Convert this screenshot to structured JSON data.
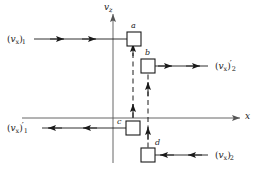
{
  "figure": {
    "background_color": "#ffffff",
    "line_color": "#1a1a1a",
    "axis_color": "#555555",
    "dashed_color": "#1a1a1a"
  },
  "axes": {
    "vertical": {
      "label_text": "v",
      "label_sub": "z",
      "name": "v_z"
    },
    "horizontal": {
      "label_text": "x",
      "name": "x"
    }
  },
  "boxes": [
    {
      "id": "a",
      "label": "a"
    },
    {
      "id": "b",
      "label": "b"
    },
    {
      "id": "c",
      "label": "c"
    },
    {
      "id": "d",
      "label": "d"
    }
  ],
  "velocity_labels": {
    "incoming_1": {
      "open_paren": "(",
      "symbol": "v",
      "symbol_sub": "x",
      "close_paren": ")",
      "prime": "",
      "index": "1",
      "full_text": "(v_x)_1",
      "direction": "right"
    },
    "outgoing_2": {
      "open_paren": "(",
      "symbol": "v",
      "symbol_sub": "x",
      "close_paren": ")",
      "prime": "′",
      "index": "2",
      "full_text": "(v_x)'_2",
      "direction": "right"
    },
    "outgoing_1": {
      "open_paren": "(",
      "symbol": "v",
      "symbol_sub": "x",
      "close_paren": ")",
      "prime": "′",
      "index": "1",
      "full_text": "(v_x)'_1",
      "direction": "left"
    },
    "incoming_2": {
      "open_paren": "(",
      "symbol": "v",
      "symbol_sub": "x",
      "close_paren": ")",
      "prime": "",
      "index": "2",
      "full_text": "(v_x)_2",
      "direction": "left"
    }
  }
}
